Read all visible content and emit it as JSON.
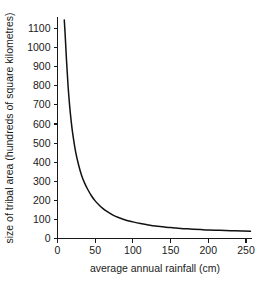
{
  "chart_data": {
    "type": "line",
    "title": "",
    "subtitle": "",
    "xlabel": "average annual rainfall (cm)",
    "ylabel": "size of tribal area (hundreds of square kilometres)",
    "xlim": [
      0,
      258
    ],
    "ylim": [
      0,
      1150
    ],
    "grid": false,
    "legend": "none",
    "xticks": [
      0,
      50,
      100,
      150,
      200,
      250
    ],
    "xtick_labels": [
      "0",
      "50",
      "100",
      "150",
      "200",
      "250"
    ],
    "yticks": [
      0,
      100,
      200,
      300,
      400,
      500,
      600,
      700,
      800,
      900,
      1000,
      1100
    ],
    "ytick_labels": [
      "0",
      "100",
      "200",
      "300",
      "400",
      "500",
      "600",
      "700",
      "800",
      "900",
      "1000",
      "1100"
    ],
    "series": [
      {
        "name": "tribal area vs rainfall",
        "color": "#111111",
        "x": [
          9,
          10,
          12,
          14,
          16,
          18,
          20,
          24,
          28,
          32,
          36,
          40,
          45,
          50,
          55,
          60,
          65,
          70,
          75,
          80,
          90,
          100,
          110,
          120,
          130,
          140,
          150,
          160,
          170,
          180,
          190,
          200,
          215,
          230,
          245,
          256
        ],
        "y": [
          1145,
          1080,
          930,
          800,
          700,
          620,
          555,
          455,
          385,
          330,
          290,
          258,
          224,
          197,
          176,
          158,
          143,
          131,
          120,
          111,
          97,
          87,
          78,
          71,
          65,
          61,
          57,
          54,
          51,
          49,
          47,
          45,
          43,
          41,
          39,
          38
        ]
      }
    ],
    "annotations": []
  },
  "axes": {
    "y_axis_name": "y-axis",
    "x_axis_name": "x-axis"
  },
  "colors": {
    "background": "#ffffff",
    "axis": "#1a1a1a",
    "curve": "#111111",
    "text": "#1a1a1a"
  }
}
